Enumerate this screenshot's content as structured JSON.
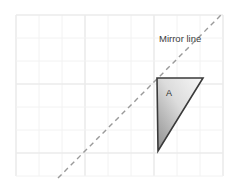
{
  "figure": {
    "title": "",
    "labels": {
      "mirror_line": "Mirror line",
      "shape_a": "A"
    },
    "colors": {
      "background": "#ffffff",
      "grid_minor": "#f2f2f2",
      "grid_major": "#ebebeb",
      "mirror_line": "#9a9a9a",
      "shape_outline": "#3a3a3a",
      "shape_fill_light": "#f4f4f4",
      "shape_fill_dark": "#8c8c8c",
      "text": "#3c3c3c"
    },
    "grid": {
      "visible": true,
      "origin_x": 16,
      "origin_y": 15,
      "cell_size": 23,
      "cols": 9,
      "rows": 7,
      "major_every": 3
    },
    "mirror_line": {
      "style": "dashed",
      "dash_pattern": "5 4",
      "stroke_width": 1.4,
      "x1": 58,
      "y1": 178,
      "x2": 223,
      "y2": 13
    },
    "mirror_label_position": {
      "x": 159,
      "y": 42
    },
    "shape": {
      "name": "A",
      "type": "right-triangle",
      "points": "157,78 203,78 158,151",
      "label_position": {
        "x": 166,
        "y": 96
      },
      "stroke_width": 1.6,
      "gradient": {
        "from": "#f6f6f6",
        "to": "#8f8f8f",
        "direction": "top-right-to-bottom-left"
      }
    }
  }
}
